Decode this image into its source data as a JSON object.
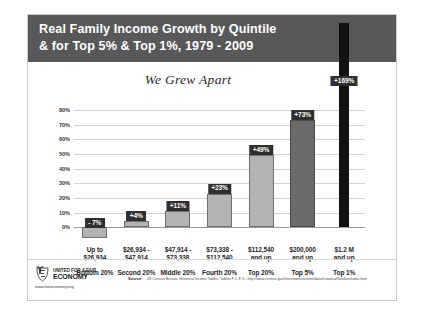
{
  "title": {
    "line1": "Real Family Income Growth by Quintile",
    "line2": "& for Top 5% & Top 1%, 1979 - 2009"
  },
  "subtitle": "We Grew Apart",
  "footer": {
    "logo_line1": "UNITED FOR A FAIR",
    "logo_line2": "ECONOMY",
    "logo_url": "www.faireconomy.org",
    "source_label": "Source:",
    "source_text": "US Census Bureau, Historical Income Tables, Tables F-1, F-3 - http://www.census.gov/hhes/www/income/data/historical/families/index.html"
  },
  "colors": {
    "banner": "#58585a",
    "bar_light": "#b3b3b3",
    "bar_dark": "#6a6a6a",
    "bar_black": "#111111",
    "badge": "#2f2f2f",
    "grid": "#d2d2d2"
  },
  "chart_data": {
    "type": "bar",
    "title": "Real Family Income Growth by Quintile & for Top 5% & Top 1%, 1979 - 2009",
    "subtitle": "We Grew Apart",
    "xlabel": "",
    "ylabel": "",
    "ylim": [
      -10,
      80
    ],
    "grid": true,
    "legend": "none",
    "yticks": [
      "0%",
      "10%",
      "20%",
      "30%",
      "40%",
      "50%",
      "60%",
      "70%",
      "80%"
    ],
    "ytick_values": [
      0,
      10,
      20,
      30,
      40,
      50,
      60,
      70,
      80
    ],
    "categories": [
      "Bottom 20%",
      "Second 20%",
      "Middle 20%",
      "Fourth 20%",
      "Top 20%",
      "Top 5%",
      "Top 1%"
    ],
    "income_ranges": [
      "Up to\n$26,934",
      "$26,934 -\n$47,914",
      "$47,914 -\n$73,338",
      "$73,338 -\n$112,540",
      "$112,540\nand up",
      "$200,000\nand up",
      "$1.2 M\nand up"
    ],
    "values": [
      -7,
      4,
      11,
      23,
      49,
      73,
      169
    ],
    "data_labels": [
      "- 7%",
      "+4%",
      "+11%",
      "+23%",
      "+49%",
      "+73%",
      "+169%"
    ]
  },
  "bars": [
    {
      "category": "Bottom 20%",
      "range_line1": "Up to",
      "range_line2": "$26,934",
      "value": -7,
      "label": "- 7%",
      "style": "light"
    },
    {
      "category": "Second 20%",
      "range_line1": "$26,934 -",
      "range_line2": "$47,914",
      "value": 4,
      "label": "+4%",
      "style": "light"
    },
    {
      "category": "Middle 20%",
      "range_line1": "$47,914 -",
      "range_line2": "$73,338",
      "value": 11,
      "label": "+11%",
      "style": "light"
    },
    {
      "category": "Fourth 20%",
      "range_line1": "$73,338 -",
      "range_line2": "$112,540",
      "value": 23,
      "label": "+23%",
      "style": "light"
    },
    {
      "category": "Top 20%",
      "range_line1": "$112,540",
      "range_line2": "and up",
      "value": 49,
      "label": "+49%",
      "style": "light"
    },
    {
      "category": "Top 5%",
      "range_line1": "$200,000",
      "range_line2": "and up",
      "value": 73,
      "label": "+73%",
      "style": "dark"
    },
    {
      "category": "Top 1%",
      "range_line1": "$1.2 M",
      "range_line2": "and up",
      "value": 169,
      "label": "+169%",
      "style": "black"
    }
  ]
}
